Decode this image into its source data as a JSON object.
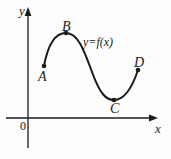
{
  "figure": {
    "background_color": "#fdfdfd",
    "ink_color": "#1a1a1a",
    "axes": {
      "x_label": "x",
      "y_label": "y",
      "origin_label": "0",
      "x_axis": {
        "y": 118,
        "x_start": 6,
        "x_end": 158,
        "arrow": "right"
      },
      "y_axis": {
        "x": 28,
        "y_start": 8,
        "y_end": 148,
        "arrow": "up"
      }
    },
    "curve": {
      "function_label": "y=f(x)",
      "stroke_width": 2.0,
      "shape": "S-curve: rises from A to local maximum B, falls to local minimum C, rises to D",
      "path": "M 44,66 C 48,44 55,33 66,33 C 78,33 84,50 92,72 C 100,94 106,100 114,100 C 124,100 132,88 138,70"
    },
    "points": [
      {
        "id": "A",
        "label": "A",
        "role": "left-endpoint",
        "x": 44,
        "y": 66,
        "label_x": 38,
        "label_y": 70
      },
      {
        "id": "B",
        "label": "B",
        "role": "local-maximum",
        "x": 66,
        "y": 33,
        "label_x": 62,
        "label_y": 20
      },
      {
        "id": "C",
        "label": "C",
        "role": "local-minimum",
        "x": 114,
        "y": 100,
        "label_x": 110,
        "label_y": 102
      },
      {
        "id": "D",
        "label": "D",
        "role": "right-endpoint",
        "x": 138,
        "y": 70,
        "label_x": 134,
        "label_y": 56
      }
    ]
  },
  "chart_data": {
    "type": "line",
    "title": "",
    "xlabel": "x",
    "ylabel": "y",
    "grid": false,
    "legend": "none",
    "annotations": [
      "y=f(x)",
      "A",
      "B",
      "C",
      "D",
      "0",
      "x",
      "y"
    ],
    "series": [
      {
        "name": "y=f(x)",
        "points": [
          {
            "label": "A",
            "note": "left endpoint, curve start"
          },
          {
            "label": "B",
            "note": "local maximum"
          },
          {
            "label": "C",
            "note": "local minimum"
          },
          {
            "label": "D",
            "note": "right endpoint, curve end"
          }
        ]
      }
    ]
  }
}
